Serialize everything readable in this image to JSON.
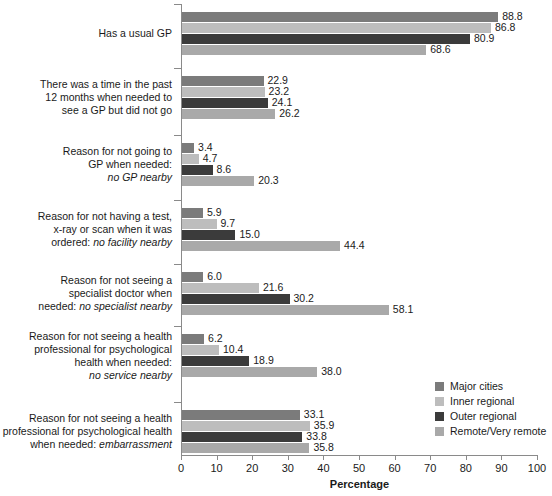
{
  "chart_data": {
    "type": "bar",
    "orientation": "horizontal",
    "title": "",
    "xlabel": "Percentage",
    "ylabel": "",
    "xlim": [
      0,
      100
    ],
    "xticks": [
      0,
      10,
      20,
      30,
      40,
      50,
      60,
      70,
      80,
      90,
      100
    ],
    "grid": false,
    "legend_position": "center-right",
    "categories": [
      "Has a usual GP",
      "There was a time in the past 12 months when needed to see a GP but did not go",
      "Reason for not going to GP when needed: no GP nearby",
      "Reason for not having a test, x-ray or scan when it was ordered: no facility nearby",
      "Reason for not seeing a specialist doctor when needed: no specialist nearby",
      "Reason for not seeing a health professional for psychological health when needed: no service nearby",
      "Reason for not seeing a health professional for psychological health when needed: embarrassment"
    ],
    "series": [
      {
        "name": "Major cities",
        "color": "#7b7b7b",
        "values": [
          88.8,
          22.9,
          3.4,
          5.9,
          6.0,
          6.2,
          33.1
        ]
      },
      {
        "name": "Inner regional",
        "color": "#bdbdbd",
        "values": [
          86.8,
          23.2,
          4.7,
          9.7,
          21.6,
          10.4,
          35.9
        ]
      },
      {
        "name": "Outer regional",
        "color": "#3b3b3b",
        "values": [
          80.9,
          24.1,
          8.6,
          15.0,
          30.2,
          18.9,
          33.8
        ]
      },
      {
        "name": "Remote/Very remote",
        "color": "#a9a9a9",
        "values": [
          68.6,
          26.2,
          20.3,
          44.4,
          58.1,
          38.0,
          35.8
        ]
      }
    ]
  },
  "category_label_lines": [
    [
      "Has a usual GP"
    ],
    [
      "There was a time in the past",
      "12 months when needed to",
      "see a GP but did not go"
    ],
    [
      "Reason for not going to",
      "GP when needed:",
      "no GP nearby"
    ],
    [
      "Reason for not having a test,",
      "x-ray or scan when it was",
      "ordered: no facility nearby"
    ],
    [
      "Reason for not seeing a",
      "specialist doctor when",
      "needed: no specialist nearby"
    ],
    [
      "Reason for not seeing a health",
      "professional for psychological",
      "health when needed:",
      "no service nearby"
    ],
    [
      "Reason for not seeing a health",
      "professional for psychological health",
      "when needed: embarrassment"
    ]
  ],
  "value_labels": [
    [
      "88.8",
      "86.8",
      "80.9",
      "68.6"
    ],
    [
      "22.9",
      "23.2",
      "24.1",
      "26.2"
    ],
    [
      "3.4",
      "4.7",
      "8.6",
      "20.3"
    ],
    [
      "5.9",
      "9.7",
      "15.0",
      "44.4"
    ],
    [
      "6.0",
      "21.6",
      "30.2",
      "58.1"
    ],
    [
      "6.2",
      "10.4",
      "18.9",
      "38.0"
    ],
    [
      "33.1",
      "35.9",
      "33.8",
      "35.8"
    ]
  ],
  "xtick_labels": [
    "0",
    "10",
    "20",
    "30",
    "40",
    "50",
    "60",
    "70",
    "80",
    "90",
    "100"
  ],
  "axis_title": "Percentage",
  "legend": {
    "items": [
      {
        "label": "Major cities",
        "color": "#7b7b7b"
      },
      {
        "label": "Inner regional",
        "color": "#bdbdbd"
      },
      {
        "label": "Outer regional",
        "color": "#3b3b3b"
      },
      {
        "label": "Remote/Very remote",
        "color": "#a9a9a9"
      }
    ]
  },
  "colors": {
    "axis": "#8a8a8a",
    "text": "#1a1a1a",
    "background": "#ffffff"
  }
}
